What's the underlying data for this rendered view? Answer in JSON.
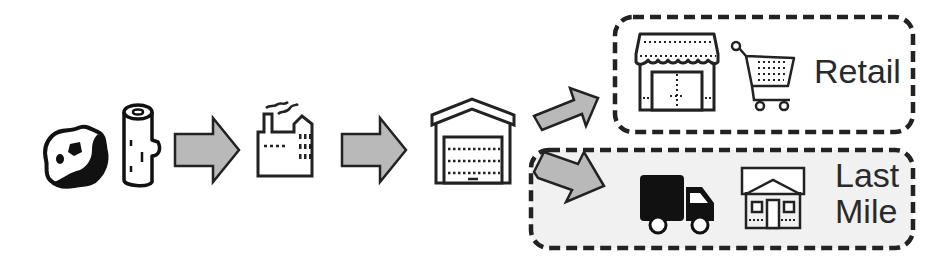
{
  "diagram": {
    "colors": {
      "stroke": "#222222",
      "arrow_fill": "#b9b9b9",
      "box_fill_last_mile": "#f1f1f1",
      "text": "#2a2a2a"
    },
    "stages": [
      {
        "id": "raw-materials",
        "icons": [
          "ore-rock-icon",
          "wood-log-icon"
        ]
      },
      {
        "id": "manufacturing",
        "icons": [
          "factory-icon"
        ]
      },
      {
        "id": "warehouse",
        "icons": [
          "warehouse-icon"
        ]
      }
    ],
    "branches": [
      {
        "id": "retail",
        "label": "Retail",
        "icons": [
          "storefront-icon",
          "shopping-cart-icon"
        ]
      },
      {
        "id": "last-mile",
        "label_line1": "Last",
        "label_line2": "Mile",
        "icons": [
          "delivery-truck-icon",
          "house-icon"
        ]
      }
    ],
    "arrows": [
      "raw-to-factory",
      "factory-to-warehouse",
      "warehouse-to-retail",
      "warehouse-to-last-mile"
    ]
  }
}
